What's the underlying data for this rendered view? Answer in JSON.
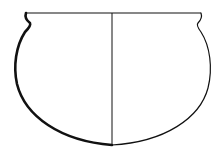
{
  "figure": {
    "type": "pottery-profile-drawing",
    "colors": {
      "background": "#ffffff",
      "line": "#111111"
    },
    "rim": {
      "y": 13,
      "left_x": 25,
      "right_x": 201
    },
    "axis": {
      "x": 112,
      "top_y": 13,
      "bottom_y": 145
    },
    "max_width_y": 68,
    "base_y": 145,
    "left_half": "section (thick wall line)",
    "right_half": "exterior view (thin outline)"
  }
}
